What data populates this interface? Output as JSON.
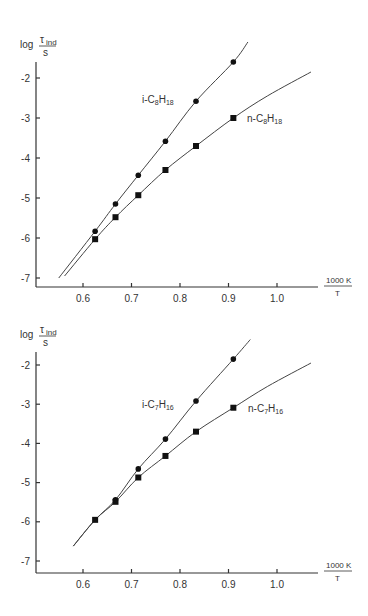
{
  "chart_data": [
    {
      "type": "line",
      "title": "",
      "ylabel": "log τ_ind / s",
      "ylabel_parts": {
        "log": "log",
        "numerator": "τ",
        "numerator_sub": "ind",
        "denominator": "s"
      },
      "xlabel": "1000 K / T",
      "xlabel_parts": {
        "numerator": "1000 K",
        "denominator": "T"
      },
      "xlim": [
        0.5,
        1.08
      ],
      "ylim": [
        -7.2,
        -1.5
      ],
      "x_ticks": [
        0.6,
        0.7,
        0.8,
        0.9,
        1.0
      ],
      "x_tick_labels": [
        "0.6",
        "0.7",
        "0.8",
        "0.9",
        "1.0"
      ],
      "y_ticks": [
        -2,
        -3,
        -4,
        -5,
        -6,
        -7
      ],
      "y_tick_labels": [
        "-2",
        "-3",
        "-4",
        "-5",
        "-6",
        "-7"
      ],
      "grid": false,
      "series": [
        {
          "name": "i-C8H18",
          "label_main": "i-C",
          "label_sub1": "8",
          "label_mid": "H",
          "label_sub2": "18",
          "marker": "circle",
          "x": [
            0.625,
            0.667,
            0.714,
            0.77,
            0.833,
            0.91
          ],
          "values": [
            -5.83,
            -5.15,
            -4.43,
            -3.58,
            -2.58,
            -1.6
          ],
          "curve": [
            [
              0.55,
              -7.0
            ],
            [
              0.625,
              -5.83
            ],
            [
              0.667,
              -5.15
            ],
            [
              0.714,
              -4.43
            ],
            [
              0.77,
              -3.58
            ],
            [
              0.833,
              -2.58
            ],
            [
              0.91,
              -1.6
            ],
            [
              0.94,
              -1.1
            ]
          ]
        },
        {
          "name": "n-C8H18",
          "label_main": "n-C",
          "label_sub1": "8",
          "label_mid": "H",
          "label_sub2": "18",
          "marker": "square",
          "x": [
            0.625,
            0.667,
            0.714,
            0.77,
            0.833,
            0.91
          ],
          "values": [
            -6.03,
            -5.48,
            -4.93,
            -4.3,
            -3.7,
            -3.0
          ],
          "curve": [
            [
              0.562,
              -6.95
            ],
            [
              0.625,
              -6.03
            ],
            [
              0.667,
              -5.48
            ],
            [
              0.714,
              -4.93
            ],
            [
              0.77,
              -4.3
            ],
            [
              0.833,
              -3.7
            ],
            [
              0.91,
              -3.0
            ],
            [
              0.98,
              -2.45
            ],
            [
              1.07,
              -1.85
            ]
          ]
        }
      ]
    },
    {
      "type": "line",
      "title": "",
      "ylabel": "log τ_ind / s",
      "ylabel_parts": {
        "log": "log",
        "numerator": "τ",
        "numerator_sub": "ind",
        "denominator": "s"
      },
      "xlabel": "1000 K / T",
      "xlabel_parts": {
        "numerator": "1000 K",
        "denominator": "T"
      },
      "xlim": [
        0.5,
        1.08
      ],
      "ylim": [
        -7.3,
        -1.5
      ],
      "x_ticks": [
        0.6,
        0.7,
        0.8,
        0.9,
        1.0
      ],
      "x_tick_labels": [
        "0.6",
        "0.7",
        "0.8",
        "0.9",
        "1.0"
      ],
      "y_ticks": [
        -2,
        -3,
        -4,
        -5,
        -6,
        -7
      ],
      "y_tick_labels": [
        "-2",
        "-3",
        "-4",
        "-5",
        "-6",
        "-7"
      ],
      "grid": false,
      "series": [
        {
          "name": "i-C7H16",
          "label_main": "i-C",
          "label_sub1": "7",
          "label_mid": "H",
          "label_sub2": "16",
          "marker": "circle",
          "x": [
            0.667,
            0.714,
            0.77,
            0.833,
            0.91
          ],
          "values": [
            -5.44,
            -4.65,
            -3.89,
            -2.92,
            -1.85
          ],
          "curve": [
            [
              0.58,
              -6.62
            ],
            [
              0.625,
              -5.95
            ],
            [
              0.667,
              -5.44
            ],
            [
              0.714,
              -4.65
            ],
            [
              0.77,
              -3.89
            ],
            [
              0.833,
              -2.92
            ],
            [
              0.91,
              -1.85
            ],
            [
              0.945,
              -1.35
            ]
          ]
        },
        {
          "name": "n-C7H16",
          "label_main": "n-C",
          "label_sub1": "7",
          "label_mid": "H",
          "label_sub2": "16",
          "marker": "square",
          "x": [
            0.625,
            0.667,
            0.714,
            0.77,
            0.833,
            0.91
          ],
          "values": [
            -5.95,
            -5.49,
            -4.87,
            -4.32,
            -3.7,
            -3.09
          ],
          "curve": [
            [
              0.58,
              -6.62
            ],
            [
              0.625,
              -5.95
            ],
            [
              0.667,
              -5.49
            ],
            [
              0.714,
              -4.87
            ],
            [
              0.77,
              -4.32
            ],
            [
              0.833,
              -3.7
            ],
            [
              0.91,
              -3.09
            ],
            [
              0.98,
              -2.55
            ],
            [
              1.07,
              -1.95
            ]
          ]
        }
      ]
    }
  ]
}
